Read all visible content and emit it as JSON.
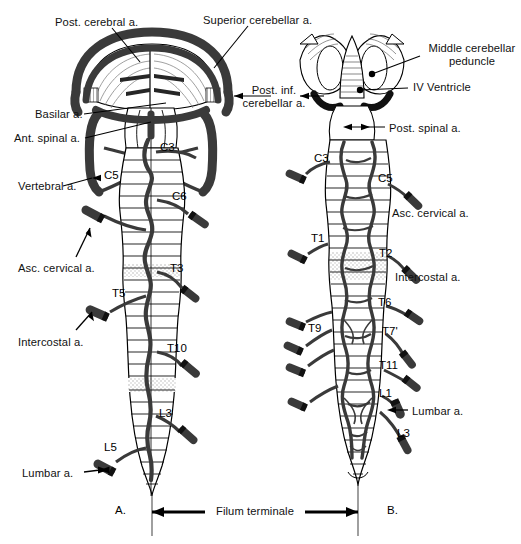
{
  "figure": {
    "caption": "Filum terminale",
    "panels": [
      {
        "id": "A",
        "label": "A.",
        "view": "anterior"
      },
      {
        "id": "B",
        "label": "B.",
        "view": "posterior"
      }
    ],
    "colors": {
      "artery": "#3a3a3a",
      "artery_dark": "#2b2b2b",
      "outline": "#000000",
      "hatch": "#555555",
      "stipple": "#d8d8d8",
      "background": "#ffffff"
    }
  },
  "left_figure": {
    "callouts": [
      {
        "name": "post-cerebral-artery",
        "text": "Post. cerebral a.",
        "x": 55,
        "y": 16,
        "align": "left"
      },
      {
        "name": "superior-cerebellar-artery",
        "text": "Superior cerebellar a.",
        "x": 203,
        "y": 14,
        "align": "left"
      },
      {
        "name": "post-inf-cerebellar-artery",
        "text": "Post. inf.\ncerebellar a.",
        "x": 228,
        "y": 84,
        "align": "left"
      },
      {
        "name": "basilar-artery",
        "text": "Basilar a.",
        "x": 35,
        "y": 108,
        "align": "left"
      },
      {
        "name": "ant-spinal-artery",
        "text": "Ant. spinal a.",
        "x": 14,
        "y": 132,
        "align": "left"
      },
      {
        "name": "vertebral-artery",
        "text": "Vertebral a.",
        "x": 18,
        "y": 180,
        "align": "left"
      },
      {
        "name": "asc-cervical-artery",
        "text": "Asc. cervical a.",
        "x": 18,
        "y": 262,
        "align": "left"
      },
      {
        "name": "intercostal-artery",
        "text": "Intercostal a.",
        "x": 18,
        "y": 336,
        "align": "left"
      },
      {
        "name": "lumbar-artery",
        "text": "Lumbar a.",
        "x": 22,
        "y": 467,
        "align": "left"
      }
    ],
    "segments": [
      {
        "name": "segment-c3",
        "text": "C3",
        "x": 160,
        "y": 141
      },
      {
        "name": "segment-c5",
        "text": "C5",
        "x": 104,
        "y": 169
      },
      {
        "name": "segment-c6",
        "text": "C6",
        "x": 172,
        "y": 190
      },
      {
        "name": "segment-t3",
        "text": "T3",
        "x": 170,
        "y": 262
      },
      {
        "name": "segment-t5",
        "text": "T5",
        "x": 112,
        "y": 287
      },
      {
        "name": "segment-t10",
        "text": "T10",
        "x": 167,
        "y": 342
      },
      {
        "name": "segment-l3",
        "text": "L3",
        "x": 159,
        "y": 407
      },
      {
        "name": "segment-l5",
        "text": "L5",
        "x": 104,
        "y": 441
      }
    ],
    "panel_letter": {
      "text": "A.",
      "x": 115,
      "y": 510
    }
  },
  "right_figure": {
    "callouts": [
      {
        "name": "middle-cerebellar-peduncle",
        "text": "Middle cerebellar\npeduncle",
        "x": 424,
        "y": 42,
        "align": "left"
      },
      {
        "name": "iv-ventricle",
        "text": "IV Ventricle",
        "x": 413,
        "y": 81,
        "align": "left"
      },
      {
        "name": "post-spinal-artery",
        "text": "Post. spinal a.",
        "x": 389,
        "y": 122,
        "align": "left"
      },
      {
        "name": "asc-cervical-artery-right",
        "text": "Asc. cervical a.",
        "x": 392,
        "y": 207,
        "align": "left"
      },
      {
        "name": "intercostal-artery-right",
        "text": "Intercostal a.",
        "x": 395,
        "y": 271,
        "align": "left"
      },
      {
        "name": "lumbar-artery-right",
        "text": "Lumbar a.",
        "x": 412,
        "y": 405,
        "align": "left"
      }
    ],
    "segments": [
      {
        "name": "segment-c3-right",
        "text": "C3",
        "x": 314,
        "y": 152
      },
      {
        "name": "segment-c5-right",
        "text": "C5",
        "x": 378,
        "y": 172
      },
      {
        "name": "segment-t1-right",
        "text": "T1",
        "x": 311,
        "y": 232
      },
      {
        "name": "segment-t2-right",
        "text": "T2",
        "x": 379,
        "y": 247
      },
      {
        "name": "segment-t6-right",
        "text": "T6",
        "x": 378,
        "y": 296
      },
      {
        "name": "segment-t9-right",
        "text": "T9",
        "x": 308,
        "y": 322
      },
      {
        "name": "segment-t7-right",
        "text": "T7'",
        "x": 382,
        "y": 325
      },
      {
        "name": "segment-t11-right",
        "text": "T11",
        "x": 379,
        "y": 359
      },
      {
        "name": "segment-l1-right",
        "text": "L1",
        "x": 379,
        "y": 387
      },
      {
        "name": "segment-l3-right",
        "text": "L3",
        "x": 397,
        "y": 427
      }
    ],
    "panel_letter": {
      "text": "B.",
      "x": 387,
      "y": 510
    }
  },
  "footer": {
    "filum_label": "Filum terminale",
    "filum_x": 216,
    "filum_y": 510
  }
}
